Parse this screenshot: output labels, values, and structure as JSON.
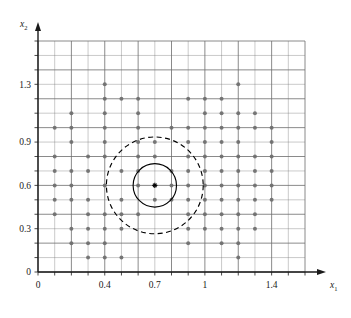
{
  "figure": {
    "title": "",
    "background_color": "#ffffff"
  },
  "axes": {
    "x_axis_label": "x",
    "x_axis_subscript": "1",
    "y_axis_label": "x",
    "y_axis_subscript": "2",
    "x_tick_labels": [
      "0",
      "0.4",
      "0.7",
      "1",
      "1.4"
    ],
    "y_tick_labels": [
      "0",
      "0.3",
      "0.6",
      "0.9",
      "1.3"
    ],
    "axis_color": "#1a1a1a",
    "grid_color": "#6e6e6e",
    "grid_on": true
  },
  "chart_data": {
    "type": "scatter",
    "title": "",
    "xlabel": "x1",
    "ylabel": "x2",
    "xlim": [
      0,
      1.6
    ],
    "ylim": [
      0,
      1.6
    ],
    "grid": true,
    "x_ticks": [
      0,
      0.4,
      0.7,
      1,
      1.4
    ],
    "y_ticks": [
      0,
      0.3,
      0.6,
      0.9,
      1.3
    ],
    "grid_step": 0.1,
    "grid_lines_x": [
      0,
      0.1,
      0.2,
      0.3,
      0.4,
      0.5,
      0.6,
      0.7,
      0.8,
      0.9,
      1.0,
      1.1,
      1.2,
      1.3,
      1.4,
      1.5,
      1.6
    ],
    "grid_lines_y": [
      0,
      0.1,
      0.2,
      0.3,
      0.4,
      0.5,
      0.6,
      0.7,
      0.8,
      0.9,
      1.0,
      1.1,
      1.2,
      1.3,
      1.4,
      1.5,
      1.6
    ],
    "point_color": "#6e6e6e",
    "point_radius": 2.0,
    "points": [
      [
        0.4,
        1.3
      ],
      [
        1.2,
        1.3
      ],
      [
        0.4,
        1.2
      ],
      [
        0.5,
        1.2
      ],
      [
        0.6,
        1.2
      ],
      [
        0.9,
        1.2
      ],
      [
        1.0,
        1.2
      ],
      [
        1.1,
        1.2
      ],
      [
        0.2,
        1.1
      ],
      [
        0.4,
        1.1
      ],
      [
        0.6,
        1.1
      ],
      [
        1.0,
        1.1
      ],
      [
        1.1,
        1.1
      ],
      [
        1.2,
        1.1
      ],
      [
        1.3,
        1.1
      ],
      [
        0.1,
        1.0
      ],
      [
        0.2,
        1.0
      ],
      [
        0.4,
        1.0
      ],
      [
        0.6,
        1.0
      ],
      [
        0.8,
        1.0
      ],
      [
        0.9,
        1.0
      ],
      [
        1.0,
        1.0
      ],
      [
        1.1,
        1.0
      ],
      [
        1.2,
        1.0
      ],
      [
        1.3,
        1.0
      ],
      [
        1.4,
        1.0
      ],
      [
        0.2,
        0.9
      ],
      [
        0.4,
        0.9
      ],
      [
        0.6,
        0.9
      ],
      [
        0.7,
        0.9
      ],
      [
        0.9,
        0.9
      ],
      [
        1.0,
        0.9
      ],
      [
        1.1,
        0.9
      ],
      [
        1.2,
        0.9
      ],
      [
        1.4,
        0.9
      ],
      [
        0.1,
        0.8
      ],
      [
        0.3,
        0.8
      ],
      [
        0.4,
        0.8
      ],
      [
        0.6,
        0.8
      ],
      [
        0.7,
        0.8
      ],
      [
        0.9,
        0.8
      ],
      [
        1.0,
        0.8
      ],
      [
        1.1,
        0.8
      ],
      [
        1.2,
        0.8
      ],
      [
        1.3,
        0.8
      ],
      [
        1.4,
        0.8
      ],
      [
        0.1,
        0.7
      ],
      [
        0.2,
        0.7
      ],
      [
        0.3,
        0.7
      ],
      [
        0.5,
        0.7
      ],
      [
        0.6,
        0.7
      ],
      [
        0.8,
        0.7
      ],
      [
        0.9,
        0.7
      ],
      [
        1.0,
        0.7
      ],
      [
        1.1,
        0.7
      ],
      [
        1.2,
        0.7
      ],
      [
        1.3,
        0.7
      ],
      [
        1.4,
        0.7
      ],
      [
        0.1,
        0.6
      ],
      [
        0.2,
        0.6
      ],
      [
        0.4,
        0.6
      ],
      [
        0.6,
        0.6
      ],
      [
        0.8,
        0.6
      ],
      [
        0.9,
        0.6
      ],
      [
        1.0,
        0.6
      ],
      [
        1.1,
        0.6
      ],
      [
        1.2,
        0.6
      ],
      [
        1.3,
        0.6
      ],
      [
        1.4,
        0.6
      ],
      [
        0.1,
        0.5
      ],
      [
        0.2,
        0.5
      ],
      [
        0.3,
        0.5
      ],
      [
        0.5,
        0.5
      ],
      [
        0.7,
        0.5
      ],
      [
        0.8,
        0.5
      ],
      [
        0.9,
        0.5
      ],
      [
        1.0,
        0.5
      ],
      [
        1.1,
        0.5
      ],
      [
        1.2,
        0.5
      ],
      [
        1.3,
        0.5
      ],
      [
        1.4,
        0.5
      ],
      [
        0.1,
        0.4
      ],
      [
        0.3,
        0.4
      ],
      [
        0.4,
        0.4
      ],
      [
        0.5,
        0.4
      ],
      [
        0.6,
        0.4
      ],
      [
        0.9,
        0.4
      ],
      [
        1.0,
        0.4
      ],
      [
        1.1,
        0.4
      ],
      [
        1.2,
        0.4
      ],
      [
        1.3,
        0.4
      ],
      [
        0.2,
        0.3
      ],
      [
        0.3,
        0.3
      ],
      [
        0.4,
        0.3
      ],
      [
        0.5,
        0.3
      ],
      [
        0.9,
        0.3
      ],
      [
        1.0,
        0.3
      ],
      [
        1.1,
        0.3
      ],
      [
        1.2,
        0.3
      ],
      [
        1.3,
        0.3
      ],
      [
        0.2,
        0.2
      ],
      [
        0.3,
        0.2
      ],
      [
        0.4,
        0.2
      ],
      [
        0.9,
        0.2
      ],
      [
        1.1,
        0.2
      ],
      [
        1.2,
        0.2
      ],
      [
        0.3,
        0.1
      ],
      [
        0.4,
        0.1
      ],
      [
        0.5,
        0.1
      ],
      [
        1.2,
        0.1
      ]
    ],
    "center_marker": {
      "x": 0.7,
      "y": 0.6,
      "style": "asterisk",
      "color": "#000000"
    },
    "circles": [
      {
        "name": "inner-solid-circle",
        "center_x": 0.7,
        "center_y": 0.6,
        "radius": 0.13,
        "line_style": "solid",
        "color": "#000000"
      },
      {
        "name": "outer-dashed-circle",
        "center_x": 0.7,
        "center_y": 0.6,
        "radius": 0.29,
        "line_style": "dashed",
        "color": "#000000"
      }
    ]
  }
}
